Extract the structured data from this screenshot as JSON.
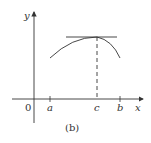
{
  "diagram": {
    "caption": "(b)",
    "axes": {
      "x_label": "x",
      "y_label": "y",
      "origin_label": "0"
    },
    "ticks": [
      {
        "label": "a",
        "x": 50
      },
      {
        "label": "c",
        "x": 97
      },
      {
        "label": "b",
        "x": 120
      }
    ],
    "curve": {
      "description": "concave-down curve from a to b with maximum at c"
    },
    "tangent": {
      "description": "horizontal tangent line at the maximum point c"
    },
    "dashed_line": {
      "description": "vertical dashed line from maximum down to c on x-axis"
    },
    "colors": {
      "stroke": "#333333",
      "background": "#ffffff"
    }
  }
}
